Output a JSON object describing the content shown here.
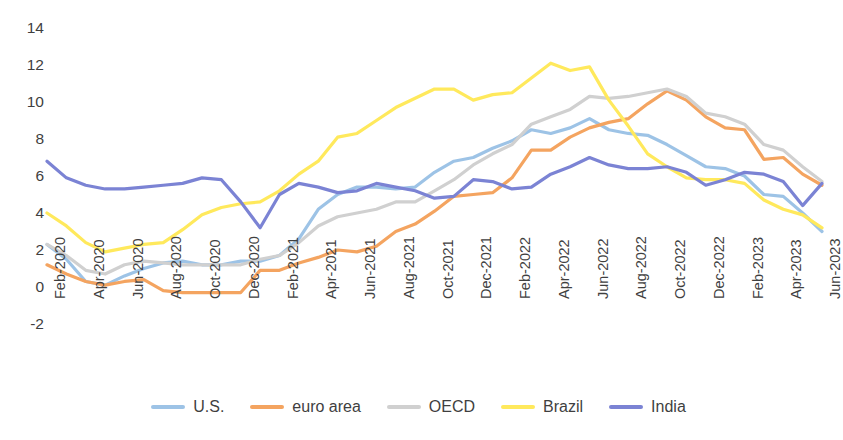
{
  "chart_data": {
    "type": "line",
    "title": "",
    "subtitle": "",
    "xlabel": "",
    "ylabel": "",
    "ylim": [
      -2,
      14
    ],
    "yticks": [
      -2,
      0,
      2,
      4,
      6,
      8,
      10,
      12,
      14
    ],
    "grid": false,
    "legend_position": "bottom",
    "x_tick_labels": [
      "Feb-2020",
      "Apr-2020",
      "Jun-2020",
      "Aug-2020",
      "Oct-2020",
      "Dec-2020",
      "Feb-2021",
      "Apr-2021",
      "Jun-2021",
      "Aug-2021",
      "Oct-2021",
      "Dec-2021",
      "Feb-2022",
      "Apr-2022",
      "Jun-2022",
      "Aug-2022",
      "Oct-2022",
      "Dec-2022",
      "Feb-2023",
      "Apr-2023",
      "Jun-2023"
    ],
    "x": [
      "Feb-2020",
      "Mar-2020",
      "Apr-2020",
      "May-2020",
      "Jun-2020",
      "Jul-2020",
      "Aug-2020",
      "Sep-2020",
      "Oct-2020",
      "Nov-2020",
      "Dec-2020",
      "Jan-2021",
      "Feb-2021",
      "Mar-2021",
      "Apr-2021",
      "May-2021",
      "Jun-2021",
      "Jul-2021",
      "Aug-2021",
      "Sep-2021",
      "Oct-2021",
      "Nov-2021",
      "Dec-2021",
      "Jan-2022",
      "Feb-2022",
      "Mar-2022",
      "Apr-2022",
      "May-2022",
      "Jun-2022",
      "Jul-2022",
      "Aug-2022",
      "Sep-2022",
      "Oct-2022",
      "Nov-2022",
      "Dec-2022",
      "Jan-2023",
      "Feb-2023",
      "Mar-2023",
      "Apr-2023",
      "May-2023",
      "Jun-2023"
    ],
    "series": [
      {
        "name": "U.S.",
        "color": "#9DC3E6",
        "values": [
          2.3,
          1.5,
          0.3,
          0.1,
          0.6,
          1.0,
          1.3,
          1.4,
          1.2,
          1.2,
          1.4,
          1.4,
          1.7,
          2.6,
          4.2,
          5.0,
          5.4,
          5.4,
          5.3,
          5.4,
          6.2,
          6.8,
          7.0,
          7.5,
          7.9,
          8.5,
          8.3,
          8.6,
          9.1,
          8.5,
          8.3,
          8.2,
          7.7,
          7.1,
          6.5,
          6.4,
          6.0,
          5.0,
          4.9,
          4.0,
          3.0
        ]
      },
      {
        "name": "euro area",
        "color": "#F4A460",
        "values": [
          1.2,
          0.7,
          0.3,
          0.1,
          0.3,
          0.4,
          -0.2,
          -0.3,
          -0.3,
          -0.3,
          -0.3,
          0.9,
          0.9,
          1.3,
          1.6,
          2.0,
          1.9,
          2.2,
          3.0,
          3.4,
          4.1,
          4.9,
          5.0,
          5.1,
          5.9,
          7.4,
          7.4,
          8.1,
          8.6,
          8.9,
          9.1,
          9.9,
          10.6,
          10.1,
          9.2,
          8.6,
          8.5,
          6.9,
          7.0,
          6.1,
          5.5
        ]
      },
      {
        "name": "OECD",
        "color": "#D0D0D0",
        "values": [
          2.3,
          1.7,
          0.9,
          0.7,
          1.2,
          1.4,
          1.3,
          1.2,
          1.2,
          1.2,
          1.2,
          1.5,
          1.7,
          2.4,
          3.3,
          3.8,
          4.0,
          4.2,
          4.6,
          4.6,
          5.2,
          5.8,
          6.6,
          7.2,
          7.7,
          8.8,
          9.2,
          9.6,
          10.3,
          10.2,
          10.3,
          10.5,
          10.7,
          10.3,
          9.4,
          9.2,
          8.8,
          7.7,
          7.4,
          6.5,
          5.7
        ]
      },
      {
        "name": "Brazil",
        "color": "#FFE95C",
        "values": [
          4.0,
          3.3,
          2.4,
          1.9,
          2.1,
          2.3,
          2.4,
          3.1,
          3.9,
          4.3,
          4.5,
          4.6,
          5.2,
          6.1,
          6.8,
          8.1,
          8.3,
          9.0,
          9.7,
          10.2,
          10.7,
          10.7,
          10.1,
          10.4,
          10.5,
          11.3,
          12.1,
          11.7,
          11.9,
          10.1,
          8.7,
          7.2,
          6.5,
          5.9,
          5.8,
          5.8,
          5.6,
          4.7,
          4.2,
          3.9,
          3.2
        ]
      },
      {
        "name": "India",
        "color": "#7B83D4",
        "values": [
          6.8,
          5.9,
          5.5,
          5.3,
          5.3,
          5.4,
          5.5,
          5.6,
          5.9,
          5.8,
          4.6,
          3.2,
          5.0,
          5.6,
          5.4,
          5.1,
          5.2,
          5.6,
          5.4,
          5.2,
          4.8,
          4.9,
          5.8,
          5.7,
          5.3,
          5.4,
          6.1,
          6.5,
          7.0,
          6.6,
          6.4,
          6.4,
          6.5,
          6.2,
          5.5,
          5.8,
          6.2,
          6.1,
          5.7,
          4.4,
          5.6
        ]
      }
    ]
  },
  "axis": {
    "y_label_values": [
      "14",
      "12",
      "10",
      "8",
      "6",
      "4",
      "2",
      "0",
      "-2"
    ]
  },
  "legend": {
    "items": [
      {
        "label": "U.S.",
        "color": "#9DC3E6"
      },
      {
        "label": "euro area",
        "color": "#F4A460"
      },
      {
        "label": "OECD",
        "color": "#D0D0D0"
      },
      {
        "label": "Brazil",
        "color": "#FFE95C"
      },
      {
        "label": "India",
        "color": "#7B83D4"
      }
    ]
  }
}
